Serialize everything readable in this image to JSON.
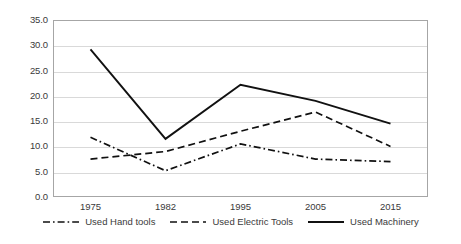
{
  "chart_data": {
    "type": "line",
    "title": "",
    "xlabel": "",
    "ylabel": "",
    "categories": [
      "1975",
      "1982",
      "1995",
      "2005",
      "2015"
    ],
    "ylim": [
      0,
      35
    ],
    "ytick_values": [
      0.0,
      5.0,
      10.0,
      15.0,
      20.0,
      25.0,
      30.0,
      35.0
    ],
    "ytick_labels": [
      "0.0",
      "5.0",
      "10.0",
      "15.0",
      "20.0",
      "25.0",
      "30.0",
      "35.0"
    ],
    "grid": true,
    "legend_position": "bottom",
    "series": [
      {
        "name": "Used Hand tools",
        "linestyle": "dash-dot",
        "color": "#111111",
        "values": [
          11.8,
          5.2,
          10.5,
          7.5,
          7.0
        ]
      },
      {
        "name": "Used Electric Tools",
        "linestyle": "dashed",
        "color": "#111111",
        "values": [
          7.5,
          9.0,
          13.0,
          16.8,
          10.0
        ]
      },
      {
        "name": "Used Machinery",
        "linestyle": "solid",
        "color": "#111111",
        "values": [
          29.2,
          11.5,
          22.2,
          19.0,
          14.5
        ]
      }
    ]
  },
  "legend": {
    "items": [
      {
        "label": "Used Hand tools",
        "style": "dash-dot"
      },
      {
        "label": "Used Electric Tools",
        "style": "dashed"
      },
      {
        "label": "Used Machinery",
        "style": "solid"
      }
    ]
  }
}
